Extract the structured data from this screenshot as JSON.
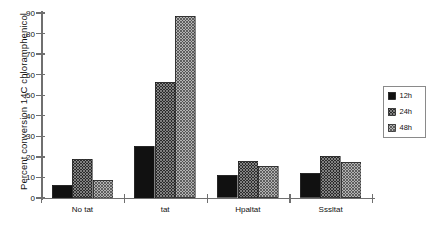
{
  "chart_data": {
    "type": "bar",
    "title": "",
    "xlabel": "",
    "ylabel": "Percent conversion 14C chloramphenicol",
    "ylim": [
      0,
      90
    ],
    "yticks": [
      0,
      10,
      20,
      30,
      40,
      50,
      60,
      70,
      80,
      90
    ],
    "ytick_labels": [
      "0",
      "10",
      "20",
      "30",
      "40",
      "50",
      "60",
      "70",
      "80",
      "90"
    ],
    "grid": false,
    "legend_position": "right",
    "categories": [
      "No tat",
      "tat",
      "Hpaltat",
      "Sssltat"
    ],
    "series": [
      {
        "name": "12h",
        "values": [
          6.5,
          25.5,
          11,
          12
        ],
        "fill": "solid-black",
        "color": "#111111"
      },
      {
        "name": "24h",
        "values": [
          19,
          56.5,
          18,
          20.5
        ],
        "fill": "dense-crosshatch",
        "color": "#3a3a3a"
      },
      {
        "name": "48h",
        "values": [
          9,
          88.5,
          15.5,
          17.5
        ],
        "fill": "light-diagonal-hatch",
        "color": "#8c8c8c"
      }
    ]
  },
  "legend": {
    "entries": [
      {
        "label": "12h"
      },
      {
        "label": "24h"
      },
      {
        "label": "48h"
      }
    ]
  },
  "axis": {
    "axis_color": "#6f6f6f"
  }
}
